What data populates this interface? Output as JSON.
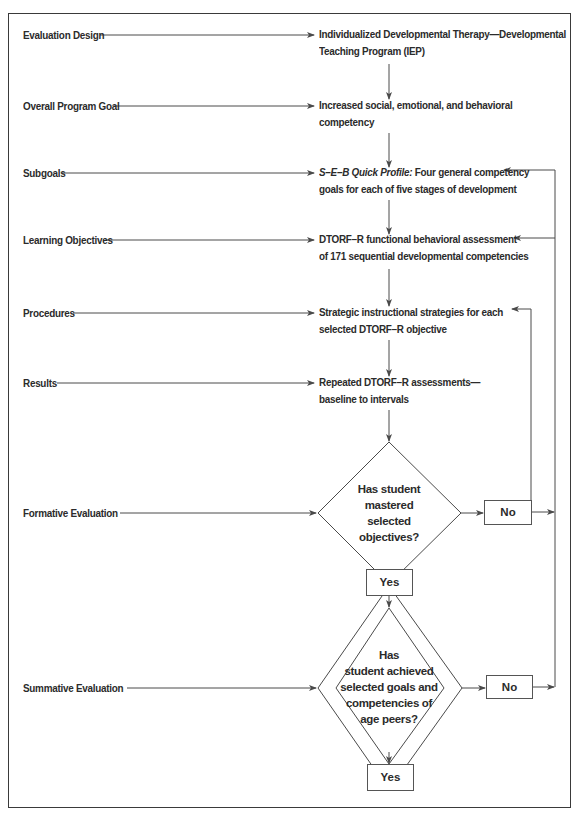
{
  "diagram": {
    "rows": [
      {
        "label": "Evaluation Design",
        "text": [
          "Individualized Developmental Therapy—Developmental",
          "Teaching Program (IEP)"
        ]
      },
      {
        "label": "Overall Program Goal",
        "text": [
          "Increased social, emotional, and behavioral",
          "competency"
        ]
      },
      {
        "label": "Subgoals",
        "text_italic": "S–E–B Quick Profile:",
        "text": [
          " Four general competency",
          "goals for each of five stages of development"
        ]
      },
      {
        "label": "Learning Objectives",
        "text": [
          "DTORF–R functional behavioral assessment",
          "of 171 sequential developmental competencies"
        ]
      },
      {
        "label": "Procedures",
        "text": [
          "Strategic instructional strategies for each",
          "selected DTORF–R objective"
        ]
      },
      {
        "label": "Results",
        "text": [
          "Repeated DTORF–R assessments—",
          "baseline to intervals"
        ]
      },
      {
        "label": "Formative Evaluation"
      },
      {
        "label": "Summative Evaluation"
      }
    ],
    "formative_decision": {
      "question": [
        "Has student",
        "mastered",
        "selected",
        "objectives?"
      ],
      "yes_label": "Yes",
      "no_label": "No"
    },
    "summative_decision": {
      "question": [
        "Has",
        "student achieved",
        "selected goals and",
        "competencies of",
        "age peers?"
      ],
      "yes_label": "Yes",
      "no_label": "No"
    },
    "colors": {
      "line": "#4a4a4a",
      "frame": "#3a3a3a",
      "text": "#2b2b2b",
      "background": "#ffffff"
    }
  }
}
